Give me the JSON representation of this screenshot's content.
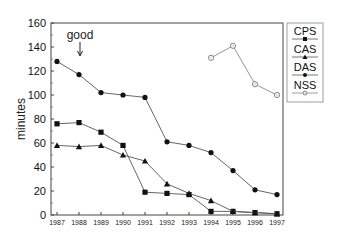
{
  "chart_data": {
    "type": "line",
    "title": "",
    "xlabel": "",
    "ylabel": "minutes",
    "ylim": [
      0,
      160
    ],
    "yticks": [
      0,
      20,
      40,
      60,
      80,
      100,
      120,
      140,
      160
    ],
    "x": [
      "1987",
      "1988",
      "1989",
      "1990",
      "1991",
      "1992",
      "1993",
      "1994",
      "1995",
      "1996",
      "1997"
    ],
    "grid": false,
    "legend_position": "right",
    "series": [
      {
        "name": "CPS",
        "marker": "square",
        "values": [
          76,
          77,
          69,
          58,
          19,
          18,
          17,
          3,
          3,
          2,
          1
        ]
      },
      {
        "name": "CAS",
        "marker": "triangle",
        "values": [
          58,
          57,
          58,
          50,
          45,
          26,
          18,
          12,
          3,
          2,
          1
        ]
      },
      {
        "name": "DAS",
        "marker": "circle",
        "values": [
          128,
          117,
          102,
          100,
          98,
          61,
          58,
          52,
          37,
          21,
          17
        ]
      },
      {
        "name": "NSS",
        "marker": "open-circle",
        "values": [
          null,
          null,
          null,
          null,
          null,
          null,
          null,
          131,
          141,
          109,
          100
        ]
      }
    ],
    "annotations": [
      {
        "text": "good",
        "x": "1988",
        "arrow": "down"
      }
    ]
  },
  "annotation_text": "good",
  "ylabel": "minutes"
}
